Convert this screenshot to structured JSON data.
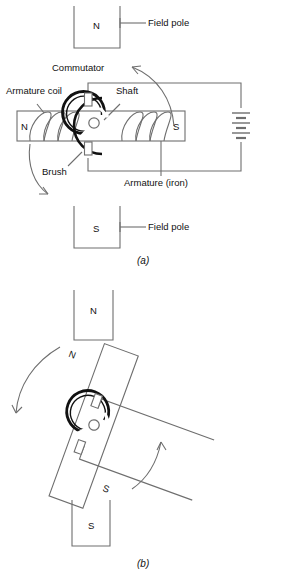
{
  "figure": {
    "title_implicit": "DC motor armature rotation diagram",
    "panels": [
      {
        "id": "a",
        "caption": "(a)",
        "labels": [
          {
            "name": "field-pole-top",
            "text": "Field pole"
          },
          {
            "name": "commutator",
            "text": "Commutator"
          },
          {
            "name": "armature-coil",
            "text": "Armature coil"
          },
          {
            "name": "shaft",
            "text": "Shaft"
          },
          {
            "name": "brush",
            "text": "Brush"
          },
          {
            "name": "armature-iron",
            "text": "Armature (iron)"
          },
          {
            "name": "field-pole-bottom",
            "text": "Field pole"
          }
        ],
        "pole_letters": {
          "top_field_pole": "N",
          "bottom_field_pole": "S",
          "armature_left_end": "N",
          "armature_right_end": "S"
        }
      },
      {
        "id": "b",
        "caption": "(b)",
        "labels": [],
        "pole_letters": {
          "top_field_pole": "N",
          "bottom_field_pole": "S",
          "armature_upper_end": "N",
          "armature_lower_end": "S"
        }
      }
    ]
  },
  "colors": {
    "line": "#6e6e6e",
    "heavy_line": "#111111",
    "text": "#111111",
    "background": "#ffffff"
  }
}
